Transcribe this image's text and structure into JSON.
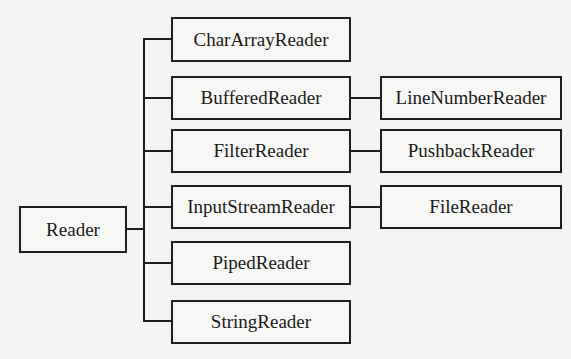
{
  "diagram": {
    "root": {
      "label": "Reader"
    },
    "children": [
      {
        "label": "CharArrayReader",
        "subclass": null
      },
      {
        "label": "BufferedReader",
        "subclass": "LineNumberReader"
      },
      {
        "label": "FilterReader",
        "subclass": "PushbackReader"
      },
      {
        "label": "InputStreamReader",
        "subclass": "FileReader"
      },
      {
        "label": "PipedReader",
        "subclass": null
      },
      {
        "label": "StringReader",
        "subclass": null
      }
    ],
    "colors": {
      "line": "#1e1e1e",
      "background": "#f4f4f2"
    }
  }
}
